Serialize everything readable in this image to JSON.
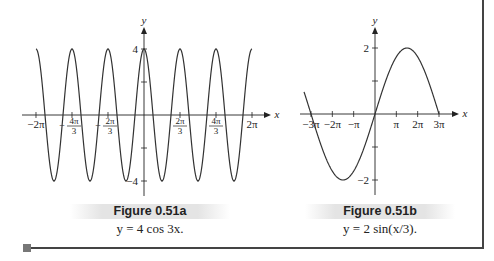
{
  "chart_data": [
    {
      "type": "line",
      "title": "Figure 0.51a",
      "subtitle": "y = 4 cos 3x.",
      "function": "y = 4*cos(3x)",
      "xlabel": "x",
      "ylabel": "y",
      "xlim": [
        -6.2832,
        6.2832
      ],
      "ylim": [
        -4,
        4
      ],
      "x_ticks": [
        {
          "value": -6.2832,
          "label": "−2π"
        },
        {
          "value": -4.1888,
          "label": "−4π/3"
        },
        {
          "value": -2.0944,
          "label": "−2π/3"
        },
        {
          "value": 2.0944,
          "label": "2π/3"
        },
        {
          "value": 4.1888,
          "label": "4π/3"
        },
        {
          "value": 6.2832,
          "label": "2π"
        }
      ],
      "y_ticks": [
        {
          "value": 4,
          "label": "4"
        },
        {
          "value": 2,
          "label": ""
        },
        {
          "value": -2,
          "label": ""
        },
        {
          "value": -4,
          "label": "−4"
        }
      ],
      "grid": false,
      "sample_points": {
        "x": [
          -6.2832,
          -5.236,
          -4.1888,
          -3.1416,
          -2.0944,
          -1.0472,
          0,
          1.0472,
          2.0944,
          3.1416,
          4.1888,
          5.236,
          6.2832
        ],
        "y": [
          4,
          -4,
          4,
          -4,
          4,
          -4,
          4,
          -4,
          4,
          -4,
          4,
          -4,
          4
        ]
      }
    },
    {
      "type": "line",
      "title": "Figure 0.51b",
      "subtitle": "y = 2 sin(x/3).",
      "function": "y = 2*sin(x/3)",
      "xlabel": "x",
      "ylabel": "y",
      "xlim": [
        -9.4248,
        9.4248
      ],
      "ylim": [
        -2,
        2
      ],
      "x_ticks": [
        {
          "value": -9.4248,
          "label": "−3π"
        },
        {
          "value": -6.2832,
          "label": "−2π"
        },
        {
          "value": -3.1416,
          "label": "−π"
        },
        {
          "value": 3.1416,
          "label": "π"
        },
        {
          "value": 6.2832,
          "label": "2π"
        },
        {
          "value": 9.4248,
          "label": "3π"
        }
      ],
      "y_ticks": [
        {
          "value": 2,
          "label": "2"
        },
        {
          "value": 1,
          "label": ""
        },
        {
          "value": -1,
          "label": ""
        },
        {
          "value": -2,
          "label": "−2"
        }
      ],
      "grid": false,
      "sample_points": {
        "x": [
          -10.5,
          -9.4248,
          -4.7124,
          0,
          4.7124,
          9.4248
        ],
        "y": [
          0.72,
          0,
          -2,
          0,
          2,
          0
        ]
      }
    }
  ],
  "figures": {
    "a": {
      "title": "Figure 0.51a",
      "equation": "y = 4 cos 3x."
    },
    "b": {
      "title": "Figure 0.51b",
      "equation": "y = 2 sin(x/3)."
    }
  },
  "colors": {
    "curve": "#333333",
    "axis": "#222222",
    "caption_bg": "#e4e4e4",
    "frame": "#444444",
    "marker": "#777777"
  }
}
